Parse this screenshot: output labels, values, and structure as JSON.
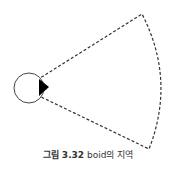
{
  "figure": {
    "caption_label": "그림 3.32",
    "caption_text": "boid의 지역"
  },
  "diagram": {
    "elements": [
      "boid-circle",
      "heading-triangle",
      "field-of-view-sector"
    ],
    "stroke_color": "#333333",
    "sector_style": "dashed"
  }
}
